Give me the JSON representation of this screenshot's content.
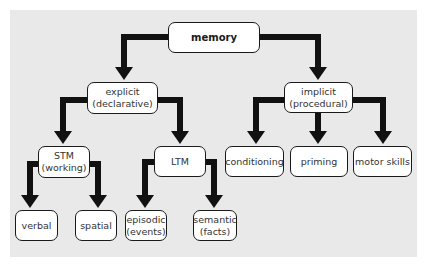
{
  "diagram": {
    "title": "memory",
    "colors": {
      "background_panel": "#e9e9e9",
      "node_fill": "#ffffff",
      "node_border": "#1a1a1a",
      "arrow": "#111111",
      "text": "#333333"
    },
    "nodes": {
      "memory": {
        "line1": "memory",
        "line2": ""
      },
      "explicit": {
        "line1": "explicit",
        "line2": "(declarative)"
      },
      "implicit": {
        "line1": "implicit",
        "line2": "(procedural)"
      },
      "stm": {
        "line1": "STM",
        "line2": "(working)"
      },
      "ltm": {
        "line1": "LTM",
        "line2": ""
      },
      "conditioning": {
        "line1": "conditioning",
        "line2": ""
      },
      "priming": {
        "line1": "priming",
        "line2": ""
      },
      "motor_skills": {
        "line1": "motor skills",
        "line2": ""
      },
      "verbal": {
        "line1": "verbal",
        "line2": ""
      },
      "spatial": {
        "line1": "spatial",
        "line2": ""
      },
      "episodic": {
        "line1": "episodic",
        "line2": "(events)"
      },
      "semantic": {
        "line1": "semantic",
        "line2": "(facts)"
      }
    },
    "edges": [
      [
        "memory",
        "explicit"
      ],
      [
        "memory",
        "implicit"
      ],
      [
        "explicit",
        "stm"
      ],
      [
        "explicit",
        "ltm"
      ],
      [
        "implicit",
        "conditioning"
      ],
      [
        "implicit",
        "priming"
      ],
      [
        "implicit",
        "motor_skills"
      ],
      [
        "stm",
        "verbal"
      ],
      [
        "stm",
        "spatial"
      ],
      [
        "ltm",
        "episodic"
      ],
      [
        "ltm",
        "semantic"
      ]
    ]
  }
}
